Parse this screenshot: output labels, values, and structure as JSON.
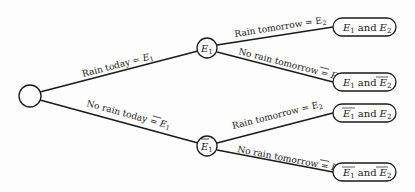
{
  "diagram": {
    "type": "probability tree",
    "root": {
      "label": ""
    },
    "branches": [
      {
        "label_text": "Rain today = ",
        "event": "E",
        "sub": "1",
        "bar": false
      },
      {
        "label_text": "No rain today = ",
        "event": "E",
        "sub": "1",
        "bar": true
      }
    ],
    "mid_nodes": [
      {
        "event": "E",
        "sub": "1",
        "bar": false
      },
      {
        "event": "E",
        "sub": "1",
        "bar": true
      }
    ],
    "sub_branches": [
      {
        "label_text": "Rain tomorrow = E",
        "sub": "2",
        "bar": false
      },
      {
        "label_text": "No rain tomorrow = ",
        "event": "E",
        "sub": "2",
        "bar": true
      },
      {
        "label_text": "Rain tomorrow = E",
        "sub": "2",
        "bar": false
      },
      {
        "label_text": "No rain tomorrow = ",
        "event": "E",
        "sub": "2",
        "bar": true
      }
    ],
    "leaves": [
      {
        "a": "E",
        "a_sub": "1",
        "a_bar": false,
        "and": "and",
        "b": "E",
        "b_sub": "2",
        "b_bar": false
      },
      {
        "a": "E",
        "a_sub": "1",
        "a_bar": false,
        "and": "and",
        "b": "E",
        "b_sub": "2",
        "b_bar": true
      },
      {
        "a": "E",
        "a_sub": "1",
        "a_bar": true,
        "and": "and",
        "b": "E",
        "b_sub": "2",
        "b_bar": false
      },
      {
        "a": "E",
        "a_sub": "1",
        "a_bar": true,
        "and": "and",
        "b": "E",
        "b_sub": "2",
        "b_bar": true
      }
    ]
  }
}
